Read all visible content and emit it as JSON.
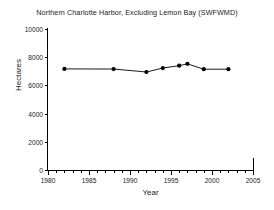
{
  "chart_data": {
    "type": "line",
    "title": "Northern Charlotte Harbor, Excluding Lemon Bay (SWFWMD)",
    "xlabel": "Year",
    "ylabel": "Hectares",
    "xlim": [
      1980,
      2005
    ],
    "ylim": [
      0,
      10000
    ],
    "xticks": [
      1980,
      1985,
      1990,
      1995,
      2000,
      2005
    ],
    "xtick_labels": [
      "1980",
      "1985",
      "1990",
      "1995",
      "2000",
      "2005"
    ],
    "xminor_step": 1,
    "yticks": [
      0,
      2000,
      4000,
      6000,
      8000,
      10000
    ],
    "ytick_labels": [
      "0",
      "2000",
      "4000",
      "6000",
      "8000",
      "10000"
    ],
    "grid": false,
    "legend": false,
    "marker": "filled-circle",
    "line_color": "#000000",
    "marker_color": "#000000",
    "x": [
      1982,
      1988,
      1992,
      1994,
      1996,
      1997,
      1999,
      2002
    ],
    "values": [
      7170,
      7160,
      6950,
      7230,
      7400,
      7530,
      7150,
      7150
    ],
    "series": [
      {
        "name": "Seagrass area",
        "points": [
          {
            "year": 1982,
            "hectares": 7170
          },
          {
            "year": 1988,
            "hectares": 7160
          },
          {
            "year": 1992,
            "hectares": 6950
          },
          {
            "year": 1994,
            "hectares": 7230
          },
          {
            "year": 1996,
            "hectares": 7400
          },
          {
            "year": 1997,
            "hectares": 7530
          },
          {
            "year": 1999,
            "hectares": 7150
          },
          {
            "year": 2002,
            "hectares": 7150
          }
        ]
      }
    ]
  }
}
